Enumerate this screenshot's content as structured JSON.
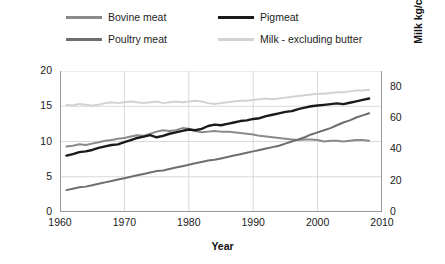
{
  "legend": {
    "items": [
      {
        "label": "Bovine meat",
        "color": "#8a8a8a",
        "key": "bovine"
      },
      {
        "label": "Pigmeat",
        "color": "#1a1a1a",
        "key": "pigmeat"
      },
      {
        "label": "Poultry meat",
        "color": "#6e6e6e",
        "key": "poultry"
      },
      {
        "label": "Milk - excluding butter",
        "color": "#d2d2d2",
        "key": "milk"
      }
    ]
  },
  "chart_data": {
    "type": "line",
    "title": "",
    "xlabel": "Year",
    "ylabel": "Meat kg/capita/year",
    "y2label": "Milk kg/capita/year",
    "xlim": [
      1960,
      2010
    ],
    "ylim": [
      0,
      20
    ],
    "y2lim": [
      0,
      90
    ],
    "xticks": [
      1960,
      1970,
      1980,
      1990,
      2000,
      2010
    ],
    "yticks": [
      0,
      5,
      10,
      15,
      20
    ],
    "y2ticks": [
      0,
      20,
      40,
      60,
      80
    ],
    "grid": "horizontal-and-vertical",
    "legend_position": "top",
    "x": [
      1961,
      1962,
      1963,
      1964,
      1965,
      1966,
      1967,
      1968,
      1969,
      1970,
      1971,
      1972,
      1973,
      1974,
      1975,
      1976,
      1977,
      1978,
      1979,
      1980,
      1981,
      1982,
      1983,
      1984,
      1985,
      1986,
      1987,
      1988,
      1989,
      1990,
      1991,
      1992,
      1993,
      1994,
      1995,
      1996,
      1997,
      1998,
      1999,
      2000,
      2001,
      2002,
      2003,
      2004,
      2005,
      2006,
      2007,
      2008
    ],
    "series": [
      {
        "name": "Bovine meat",
        "axis": "left",
        "color": "#8a8a8a",
        "values": [
          9.3,
          9.4,
          9.6,
          9.5,
          9.7,
          9.9,
          10.1,
          10.2,
          10.4,
          10.5,
          10.7,
          10.9,
          10.8,
          11.1,
          11.4,
          11.6,
          11.5,
          11.6,
          11.9,
          11.8,
          11.5,
          11.3,
          11.4,
          11.5,
          11.4,
          11.4,
          11.3,
          11.2,
          11.1,
          11.0,
          10.8,
          10.7,
          10.6,
          10.5,
          10.4,
          10.3,
          10.2,
          10.3,
          10.3,
          10.2,
          10.0,
          10.1,
          10.1,
          10.0,
          10.1,
          10.2,
          10.2,
          10.1
        ]
      },
      {
        "name": "Pigmeat",
        "axis": "left",
        "color": "#1a1a1a",
        "values": [
          8.0,
          8.2,
          8.5,
          8.6,
          8.8,
          9.1,
          9.3,
          9.5,
          9.6,
          9.9,
          10.2,
          10.5,
          10.7,
          10.9,
          10.6,
          10.8,
          11.1,
          11.3,
          11.5,
          11.7,
          11.6,
          11.8,
          12.2,
          12.4,
          12.3,
          12.5,
          12.7,
          12.9,
          13.0,
          13.2,
          13.3,
          13.6,
          13.8,
          14.0,
          14.2,
          14.3,
          14.6,
          14.8,
          15.0,
          15.1,
          15.2,
          15.3,
          15.4,
          15.3,
          15.5,
          15.7,
          15.9,
          16.1
        ]
      },
      {
        "name": "Poultry meat",
        "axis": "left",
        "color": "#6e6e6e",
        "values": [
          3.1,
          3.3,
          3.5,
          3.6,
          3.8,
          4.0,
          4.2,
          4.4,
          4.6,
          4.8,
          5.0,
          5.2,
          5.4,
          5.6,
          5.8,
          5.9,
          6.1,
          6.3,
          6.5,
          6.7,
          6.9,
          7.1,
          7.3,
          7.4,
          7.6,
          7.8,
          8.0,
          8.2,
          8.4,
          8.6,
          8.8,
          9.0,
          9.2,
          9.4,
          9.7,
          10.0,
          10.3,
          10.6,
          11.0,
          11.3,
          11.6,
          11.9,
          12.3,
          12.7,
          13.0,
          13.4,
          13.7,
          14.0
        ]
      },
      {
        "name": "Milk - excluding butter",
        "axis": "right",
        "color": "#d2d2d2",
        "values": [
          68.5,
          68.0,
          69.0,
          68.5,
          68.0,
          68.5,
          69.5,
          70.0,
          69.5,
          70.0,
          70.5,
          70.0,
          69.5,
          70.0,
          70.5,
          69.5,
          70.0,
          70.5,
          70.0,
          70.5,
          71.0,
          70.5,
          69.5,
          69.0,
          69.5,
          70.0,
          70.5,
          71.0,
          71.0,
          71.5,
          72.0,
          72.5,
          72.0,
          72.5,
          73.0,
          73.5,
          74.0,
          74.5,
          75.0,
          75.5,
          75.5,
          76.0,
          76.5,
          76.5,
          77.0,
          77.5,
          77.5,
          78.0
        ]
      }
    ]
  }
}
